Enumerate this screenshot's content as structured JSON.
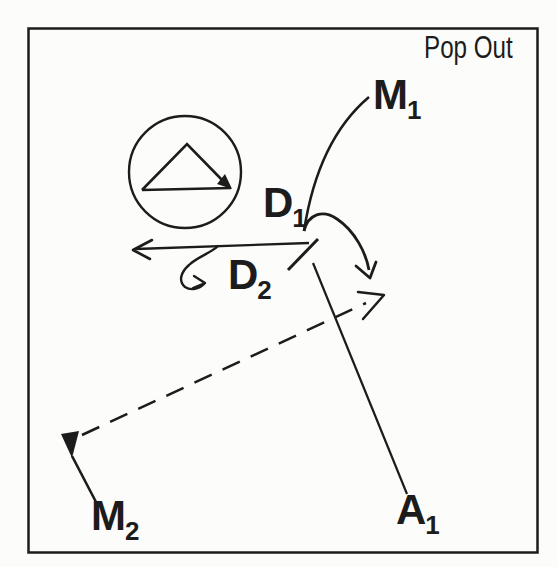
{
  "figure": {
    "corner_label": "Pop Out",
    "labels": {
      "m1": {
        "base": "M",
        "sub": "1"
      },
      "d1": {
        "base": "D",
        "sub": "1"
      },
      "d2": {
        "base": "D",
        "sub": "2"
      },
      "m2": {
        "base": "M",
        "sub": "2"
      },
      "a1": {
        "base": "A",
        "sub": "1"
      }
    },
    "colors": {
      "ink": "#1c1c1c",
      "paper": "#fcfcfa"
    }
  }
}
